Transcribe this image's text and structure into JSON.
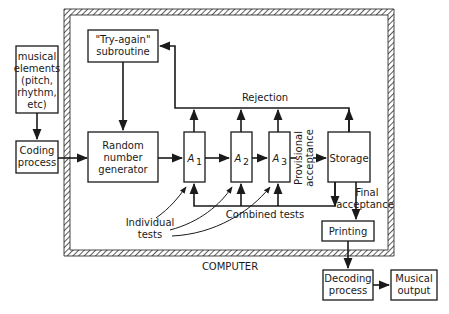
{
  "diagram": {
    "frame_label": "COMPUTER",
    "nodes": {
      "musical_elements": {
        "lines": [
          "musical",
          "elements",
          "(pitch,",
          "rhythm,",
          "etc)"
        ]
      },
      "coding_process": {
        "lines": [
          "Coding",
          "process"
        ]
      },
      "try_again": {
        "lines": [
          "\"Try-again\"",
          "subroutine"
        ]
      },
      "random_number_generator": {
        "lines": [
          "Random",
          "number",
          "generator"
        ]
      },
      "a1": {
        "label": "A",
        "sub": "1"
      },
      "a2": {
        "label": "A",
        "sub": "2"
      },
      "a3": {
        "label": "A",
        "sub": "3"
      },
      "storage": {
        "label": "Storage"
      },
      "printing": {
        "label": "Printing"
      },
      "decoding_process": {
        "lines": [
          "Decoding",
          "process"
        ]
      },
      "musical_output": {
        "lines": [
          "Musical",
          "output"
        ]
      }
    },
    "edge_labels": {
      "rejection": "Rejection",
      "provisional_acceptance": [
        "Provisional",
        "acceptance"
      ],
      "final_acceptance": [
        "Final",
        "acceptance"
      ],
      "combined_tests": "Combined tests",
      "individual_tests": [
        "Individual",
        "tests"
      ]
    },
    "colors": {
      "ink": "#1a1a1a",
      "background": "#ffffff"
    }
  }
}
